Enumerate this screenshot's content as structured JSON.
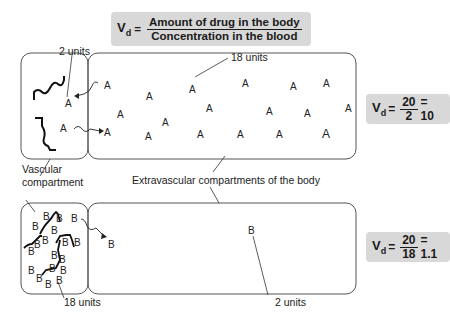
{
  "main_formula": {
    "lhs": "V",
    "lhs_sub": "d",
    "equals": "=",
    "numerator": "Amount of drug in the body",
    "denominator": "Concentration in the blood"
  },
  "top_panel": {
    "vascular_label": "2 units",
    "extravascular_label": "18 units",
    "molecule_letter": "A",
    "formula": {
      "lhs": "V",
      "lhs_sub": "d",
      "equals": "=",
      "numerator": "20",
      "denominator": "2",
      "result": "= 10"
    }
  },
  "middle_labels": {
    "vascular": "Vascular\ncompartment",
    "vascular_line1": "Vascular",
    "vascular_line2": "compartment",
    "extravascular": "Extravascular compartments of the body"
  },
  "bottom_panel": {
    "vascular_label": "18 units",
    "extravascular_label": "2 units",
    "molecule_letter": "B",
    "formula": {
      "lhs": "V",
      "lhs_sub": "d",
      "equals": "=",
      "numerator": "20",
      "denominator": "18",
      "result": "= 1.1"
    }
  },
  "colors": {
    "formula_bg": "#d8d8d8",
    "outline": "#555555",
    "text": "#222222"
  }
}
